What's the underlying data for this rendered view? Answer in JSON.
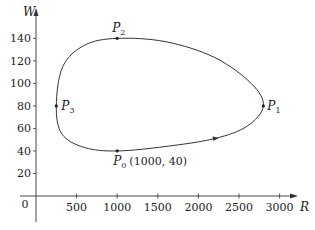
{
  "chart_data": {
    "type": "line",
    "title": "",
    "xlabel": "R",
    "ylabel": "W",
    "xlim": [
      0,
      3200
    ],
    "ylim": [
      0,
      150
    ],
    "grid": false,
    "legend": null,
    "x_ticks": [
      500,
      1000,
      1500,
      2000,
      2500,
      3000
    ],
    "x_tick_labels": [
      "500",
      "1000",
      "1500",
      "2000",
      "2500",
      "3000"
    ],
    "y_ticks": [
      20,
      40,
      60,
      80,
      100,
      120,
      140
    ],
    "y_tick_labels": [
      "20",
      "40",
      "60",
      "80",
      "100",
      "120",
      "140"
    ],
    "origin_label": "0",
    "curve": {
      "description": "closed phase-plane trajectory (predator W vs prey R), traversed counterclockwise",
      "direction": "counterclockwise",
      "points": [
        {
          "R": 1000,
          "W": 40
        },
        {
          "R": 1600,
          "W": 44
        },
        {
          "R": 2200,
          "W": 51
        },
        {
          "R": 2600,
          "W": 62
        },
        {
          "R": 2800,
          "W": 80
        },
        {
          "R": 2650,
          "W": 100
        },
        {
          "R": 2200,
          "W": 123
        },
        {
          "R": 1600,
          "W": 137
        },
        {
          "R": 1000,
          "W": 140
        },
        {
          "R": 600,
          "W": 134
        },
        {
          "R": 330,
          "W": 115
        },
        {
          "R": 250,
          "W": 80
        },
        {
          "R": 320,
          "W": 55
        },
        {
          "R": 600,
          "W": 43
        },
        {
          "R": 1000,
          "W": 40
        }
      ]
    },
    "labeled_points": [
      {
        "name": "P0",
        "label": "P",
        "sub": "0",
        "R": 1000,
        "W": 40,
        "annotation": "(1000, 40)"
      },
      {
        "name": "P1",
        "label": "P",
        "sub": "1",
        "R": 2800,
        "W": 80,
        "annotation": ""
      },
      {
        "name": "P2",
        "label": "P",
        "sub": "2",
        "R": 1000,
        "W": 140,
        "annotation": ""
      },
      {
        "name": "P3",
        "label": "P",
        "sub": "3",
        "R": 250,
        "W": 80,
        "annotation": ""
      }
    ],
    "annotations": [
      "direction arrow on curve near R≈2200, W≈50 pointing right"
    ]
  },
  "layout": {
    "origin_px": [
      36,
      196
    ],
    "px_per_R": 0.0812,
    "px_per_W": 1.126,
    "line_color": "#333333",
    "axis_color": "#333333"
  }
}
